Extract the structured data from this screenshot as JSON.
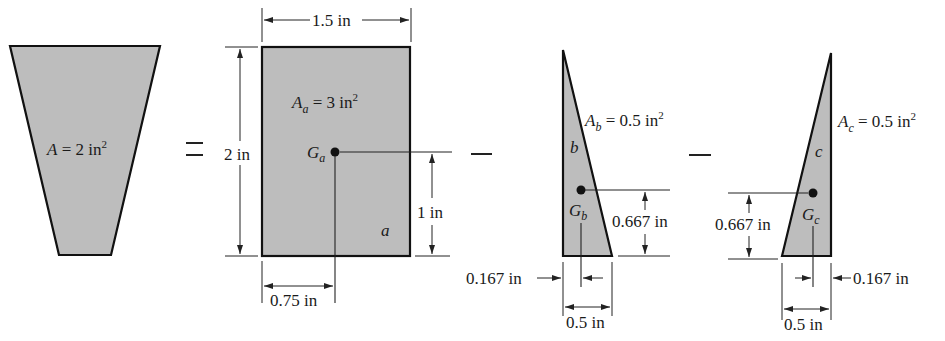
{
  "figure": {
    "colors": {
      "fill": "#bdbdbd",
      "stroke": "#111111",
      "background": "#ffffff"
    },
    "operators": {
      "equals": "=",
      "minus1": "−",
      "minus2": "−"
    },
    "composite": {
      "label_var": "A",
      "label_eq": " = 2 in",
      "label_exp": "2"
    },
    "rect_a": {
      "area_var": "A",
      "area_sub": "a",
      "area_eq": " = 3 in",
      "area_exp": "2",
      "centroid_var": "G",
      "centroid_sub": "a",
      "part_label": "a",
      "width_dim": "1.5 in",
      "height_dim": "2 in",
      "centroid_y_dim": "1 in",
      "centroid_x_dim": "0.75 in"
    },
    "tri_b": {
      "area_var": "A",
      "area_sub": "b",
      "area_eq": " = 0.5 in",
      "area_exp": "2",
      "centroid_var": "G",
      "centroid_sub": "b",
      "part_label": "b",
      "centroid_y_dim": "0.667 in",
      "centroid_x_dim": "0.167 in",
      "base_dim": "0.5 in"
    },
    "tri_c": {
      "area_var": "A",
      "area_sub": "c",
      "area_eq": " = 0.5 in",
      "area_exp": "2",
      "centroid_var": "G",
      "centroid_sub": "c",
      "part_label": "c",
      "centroid_y_dim": "0.667 in",
      "centroid_x_dim": "0.167 in",
      "base_dim": "0.5 in"
    }
  }
}
